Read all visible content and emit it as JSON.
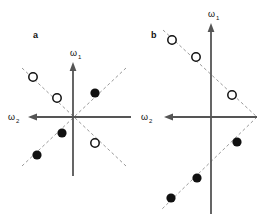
{
  "figure": {
    "background": "#ffffff",
    "axis_color": "#555555",
    "dash_color": "#999999",
    "filled_color": "#111111",
    "open_fill": "#ffffff",
    "open_stroke": "#111111"
  },
  "panels": [
    {
      "id": "a",
      "label": "a",
      "label_x": 33,
      "label_y": 38,
      "origin_x": 73,
      "origin_y": 117,
      "axes": {
        "vertical": {
          "name": "omega-1",
          "label_main": "ω",
          "label_sub": "1",
          "label_x": 70,
          "label_y": 56,
          "x": 73,
          "y_top": 63,
          "y_bottom": 176,
          "arrow": "up"
        },
        "horizontal": {
          "name": "omega-2",
          "label_main": "ω",
          "label_sub": "2",
          "label_x": 8,
          "label_y": 120,
          "y": 117,
          "x_left": 29,
          "x_right": 131,
          "arrow": "left"
        }
      },
      "dashed_lines": [
        {
          "name": "diagonal-positive",
          "x1": 22,
          "y1": 166,
          "x2": 126,
          "y2": 68
        },
        {
          "name": "diagonal-negative",
          "x1": 22,
          "y1": 68,
          "x2": 126,
          "y2": 166
        }
      ],
      "markers": [
        {
          "type": "open",
          "x": 33,
          "y": 77,
          "r": 4.2
        },
        {
          "type": "open",
          "x": 57,
          "y": 98,
          "r": 4.2
        },
        {
          "type": "filled",
          "x": 95,
          "y": 93,
          "r": 4.6
        },
        {
          "type": "filled",
          "x": 62,
          "y": 133,
          "r": 4.6
        },
        {
          "type": "filled",
          "x": 37,
          "y": 155,
          "r": 4.6
        },
        {
          "type": "open",
          "x": 95,
          "y": 143,
          "r": 4.2
        }
      ]
    },
    {
      "id": "b",
      "label": "b",
      "label_x": 151,
      "label_y": 38,
      "origin_x": 211,
      "origin_y": 117,
      "axes": {
        "vertical": {
          "name": "omega-1",
          "label_main": "ω",
          "label_sub": "1",
          "label_x": 208,
          "label_y": 17,
          "x": 211,
          "y_top": 24,
          "y_bottom": 214,
          "arrow": "up"
        },
        "horizontal": {
          "name": "omega-2",
          "label_main": "ω",
          "label_sub": "2",
          "label_x": 141,
          "label_y": 120,
          "y": 117,
          "x_left": 165,
          "x_right": 257,
          "arrow": "left"
        }
      },
      "dashed_lines": [
        {
          "name": "upper-branch",
          "x1": 163,
          "y1": 30,
          "x2": 257,
          "y2": 117
        },
        {
          "name": "lower-branch",
          "x1": 257,
          "y1": 117,
          "x2": 161,
          "y2": 210
        }
      ],
      "markers": [
        {
          "type": "open",
          "x": 172,
          "y": 40,
          "r": 4.2
        },
        {
          "type": "open",
          "x": 196,
          "y": 57,
          "r": 4.2
        },
        {
          "type": "open",
          "x": 232,
          "y": 95,
          "r": 4.2
        },
        {
          "type": "filled",
          "x": 237,
          "y": 142,
          "r": 4.6
        },
        {
          "type": "filled",
          "x": 197,
          "y": 178,
          "r": 4.6
        },
        {
          "type": "filled",
          "x": 171,
          "y": 198,
          "r": 4.6
        }
      ]
    }
  ]
}
